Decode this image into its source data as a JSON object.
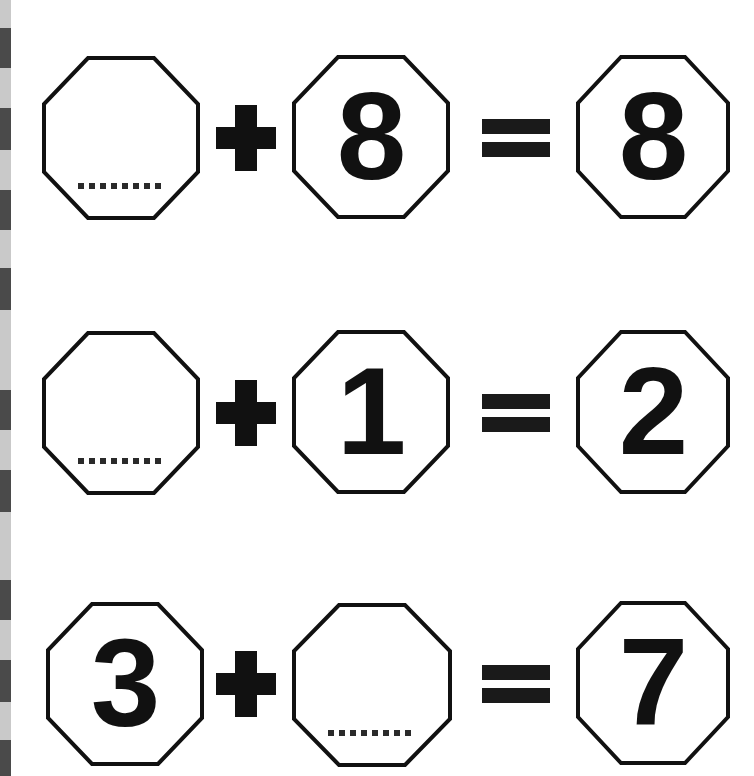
{
  "page": {
    "title": "Addition Worksheet - Missing Addend Octagons",
    "background_color": "#ffffff",
    "ink_color": "#111111",
    "binding_hole_color": "#4a4a4a",
    "binding_gap_color": "#c9c9c9"
  },
  "binding": {
    "name": "spiral-binding-edge",
    "holes": [
      {
        "top": 28,
        "height": 40
      },
      {
        "top": 108,
        "height": 42
      },
      {
        "top": 190,
        "height": 40
      },
      {
        "top": 268,
        "height": 42
      },
      {
        "top": 390,
        "height": 40
      },
      {
        "top": 470,
        "height": 42
      },
      {
        "top": 580,
        "height": 40
      },
      {
        "top": 660,
        "height": 42
      },
      {
        "top": 740,
        "height": 36
      }
    ]
  },
  "equations": [
    {
      "id": "equation-1",
      "top": 40,
      "left_operand": {
        "value": "",
        "is_blank": true,
        "shape": "octagon"
      },
      "operator_1": "+",
      "right_operand": {
        "value": "8",
        "is_blank": false,
        "shape": "octagon"
      },
      "operator_2": "=",
      "result": {
        "value": "8",
        "is_blank": false,
        "shape": "octagon"
      },
      "answer": "0"
    },
    {
      "id": "equation-2",
      "top": 315,
      "left_operand": {
        "value": "",
        "is_blank": true,
        "shape": "octagon"
      },
      "operator_1": "+",
      "right_operand": {
        "value": "1",
        "is_blank": false,
        "shape": "octagon"
      },
      "operator_2": "=",
      "result": {
        "value": "2",
        "is_blank": false,
        "shape": "octagon"
      },
      "answer": "1"
    },
    {
      "id": "equation-3",
      "top": 588,
      "left_operand": {
        "value": "3",
        "is_blank": false,
        "shape": "octagon"
      },
      "operator_1": "+",
      "right_operand": {
        "value": "",
        "is_blank": true,
        "shape": "octagon"
      },
      "operator_2": "=",
      "result": {
        "value": "7",
        "is_blank": false,
        "shape": "octagon"
      },
      "answer": "4"
    }
  ],
  "layout": {
    "cell_1_left": 42,
    "cell_2_left": 292,
    "cell_3_left": 576,
    "cell_width": 158,
    "cell_height": 164,
    "plus_left": 216,
    "equals_left": 482
  }
}
